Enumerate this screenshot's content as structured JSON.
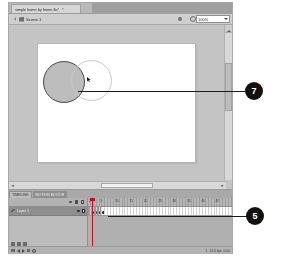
{
  "window": {
    "document_tab": {
      "title": "simple frame by frame.fla*",
      "close_label": "×"
    }
  },
  "edit_bar": {
    "back_icon": "back-arrow-icon",
    "scene_icon": "scene-icon",
    "scene_label": "Scene 1",
    "edit_scene_icon": "edit-scene-icon",
    "edit_symbol_icon": "edit-symbol-icon",
    "zoom_value": "100%",
    "zoom_caret": "chevron-down-icon"
  },
  "stage": {
    "shapes": [
      {
        "name": "filled-circle",
        "fill": "#bdbdbd",
        "stroke": "#4a4a4a"
      },
      {
        "name": "outline-circle",
        "fill": "none",
        "stroke": "#c9c9c9"
      }
    ],
    "cursor_icon": "arrow-cursor-icon"
  },
  "scrollbars": {
    "vertical_up": "▲",
    "vertical_down": "▼",
    "horizontal_left": "◄",
    "horizontal_right": "►"
  },
  "timeline": {
    "tabs": [
      {
        "label": "TIMELINE",
        "active": false
      },
      {
        "label": "MOTION EDITOR",
        "active": true
      }
    ],
    "layer_header_icons": [
      "eye-icon",
      "lock-icon",
      "outline-square-icon"
    ],
    "layers": [
      {
        "name": "Layer 1",
        "pencil_icon": "pencil-icon"
      }
    ],
    "layer_buttons": [
      "new-layer-icon",
      "new-folder-icon",
      "delete-layer-icon"
    ],
    "frame_numbers": [
      "1",
      "5",
      "10",
      "15",
      "20",
      "25",
      "30",
      "35",
      "40",
      "45"
    ],
    "keyframes": [
      0,
      1,
      2,
      3,
      4
    ],
    "playhead_frame": 1,
    "status": {
      "first_frame_icon": "first-frame-icon",
      "prev_frame_icon": "previous-frame-icon",
      "play_icon": "play-icon",
      "next_frame_icon": "next-frame-icon",
      "last_frame_icon": "last-frame-icon",
      "onion_skin_icon": "onion-skin-icon",
      "current_frame": "1",
      "frame_rate": "12.0 fps",
      "elapsed_time": "0.0s"
    }
  },
  "callouts": [
    {
      "number": "7",
      "target": "stage-shapes"
    },
    {
      "number": "5",
      "target": "timeline-frames"
    }
  ],
  "colors": {
    "window_chrome": "#c8c8c8",
    "stage_background": "#ffffff",
    "work_area": "#c4c4c4",
    "timeline_panel": "#bcbcbc",
    "callout_background": "#111111",
    "callout_text": "#ffffff",
    "playhead": "#c1121f"
  }
}
